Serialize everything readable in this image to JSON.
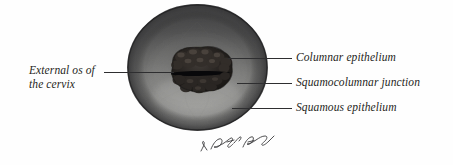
{
  "figure": {
    "type": "anatomical-illustration",
    "background_color": "#fefefe",
    "label_color": "#1f1f22",
    "leader_line_color": "#2e2e30"
  },
  "labels": {
    "columnar_epithelium": "Columnar epithelium",
    "squamocolumnar_junction": "Squamocolumnar junction",
    "squamous_epithelium": "Squamous epithelium",
    "external_os_line1": "External os of",
    "external_os_line2": "the cervix"
  },
  "illustration": {
    "name": "cervix-sphere",
    "rim_color": "#2b2b2d",
    "upper_shade_color": "#3c3c3e",
    "mid_tone_color": "#8e8e8e",
    "highlight_color": "#b8b8b6",
    "os_color": "#1d1b1a",
    "os_slit_color": "#0d0c0c"
  },
  "signature": {
    "text": "artist signature",
    "color": "#3a3a3c"
  }
}
